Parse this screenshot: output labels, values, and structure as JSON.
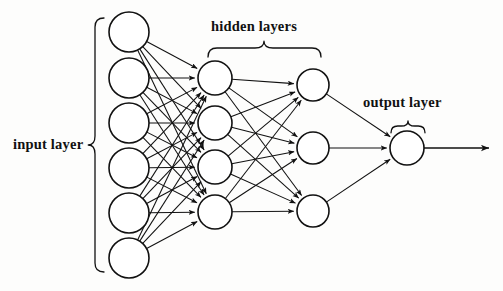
{
  "diagram": {
    "background_color": "#fdfdfc",
    "stroke_color": "#111111",
    "node_fill": "#ffffff",
    "labels": {
      "input_layer": "input layer",
      "hidden_layers": "hidden layers",
      "output_layer": "output layer"
    },
    "layers": [
      {
        "name": "input layer",
        "node_count": 6,
        "radius": 20,
        "cx": 129,
        "node_y": [
          32,
          78,
          123,
          168,
          213,
          258
        ]
      },
      {
        "name": "hidden layer 1",
        "node_count": 4,
        "radius": 17,
        "cx": 215,
        "node_y": [
          78,
          123,
          167,
          212
        ]
      },
      {
        "name": "hidden layer 2",
        "node_count": 3,
        "radius": 16,
        "cx": 313,
        "node_y": [
          85,
          148,
          211
        ]
      },
      {
        "name": "output layer",
        "node_count": 1,
        "radius": 17,
        "cx": 407,
        "node_y": [
          148
        ]
      }
    ],
    "braces": [
      {
        "name": "input-layer-brace",
        "orientation": "vertical",
        "x": 95,
        "y_start": 18,
        "y_end": 272,
        "tip_y": 145
      },
      {
        "name": "hidden-layers-brace",
        "orientation": "horizontal",
        "y": 48,
        "x_start": 208,
        "x_end": 321,
        "tip_x": 264
      },
      {
        "name": "output-layer-brace",
        "orientation": "horizontal",
        "y": 126,
        "x_start": 391,
        "x_end": 425,
        "tip_x": 408
      }
    ],
    "output_arrow": {
      "name": "output-arrow",
      "x_start": 424,
      "x_end": 489,
      "y": 148
    },
    "edges_description": "fully connected: input(6) to hidden1(4), hidden1(4) to hidden2(3), hidden2(3) to output(1)"
  }
}
